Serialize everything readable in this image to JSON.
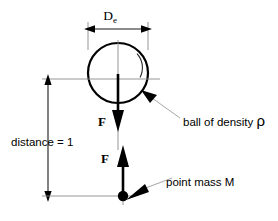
{
  "diagram": {
    "title_label": "force diagram: ball above point mass",
    "labels": {
      "diameter_symbol": "D",
      "diameter_subscript": "e",
      "distance": "distance = 1",
      "force_upper": "F",
      "force_lower": "F",
      "ball_annotation": "ball of density ",
      "ball_density_symbol": "ρ",
      "point_mass_annotation": "point mass M"
    },
    "colors": {
      "stroke_primary": "#000000",
      "stroke_thin": "#8a8a8a",
      "leader": "#9b9b9b",
      "background": "#ffffff"
    },
    "geometry": {
      "ball_center_x": 118,
      "ball_center_y": 73,
      "ball_radius": 30,
      "point_mass_x": 123,
      "point_mass_y": 196,
      "distance_dim_x": 48,
      "distance_dim_top_y": 78,
      "distance_dim_bottom_y": 196,
      "diameter_dim_y": 29,
      "diameter_dim_left_x": 88,
      "diameter_dim_right_x": 148
    }
  }
}
